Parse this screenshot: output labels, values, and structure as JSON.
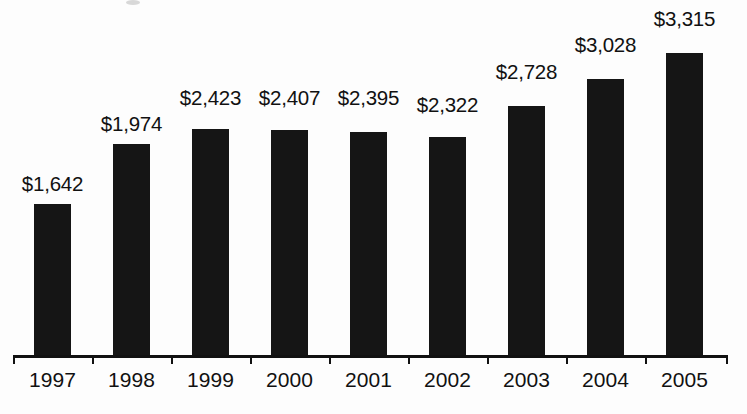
{
  "chart_data": {
    "type": "bar",
    "title": "",
    "subtitle": "",
    "xlabel": "",
    "ylabel": "",
    "categories": [
      "1997",
      "1998",
      "1999",
      "2000",
      "2001",
      "2002",
      "2003",
      "2004",
      "2005"
    ],
    "values": [
      1642,
      1974,
      2423,
      2407,
      2395,
      2322,
      2728,
      3028,
      3315
    ],
    "data_labels": [
      "$1,642",
      "$1,974",
      "$2,423",
      "$2,407",
      "$2,395",
      "$2,322",
      "$2,728",
      "$3,028",
      "$3,315"
    ],
    "series": [
      {
        "name": "",
        "values": [
          1642,
          1974,
          2423,
          2407,
          2395,
          2322,
          2728,
          3028,
          3315
        ]
      }
    ],
    "ylim": [
      0,
      3600
    ],
    "grid": false,
    "legend": false,
    "legend_position": "none",
    "value_prefix": "$",
    "bar_color": "#151515",
    "text_color": "#111111",
    "axis_color": "#111111",
    "background_color": "#fdfdfd",
    "annotations": []
  },
  "bars": [
    {
      "category": "1997",
      "value": 1642,
      "label": "$1,642",
      "left": 13,
      "bar_height": 153,
      "label_top": 172
    },
    {
      "category": "1998",
      "value": 1974,
      "label": "$1,974",
      "left": 92,
      "bar_height": 213,
      "label_top": 112
    },
    {
      "category": "1999",
      "value": 2423,
      "label": "$2,423",
      "left": 171,
      "bar_height": 228,
      "label_top": 86
    },
    {
      "category": "2000",
      "value": 2407,
      "label": "$2,407",
      "left": 250,
      "bar_height": 227,
      "label_top": 86
    },
    {
      "category": "2001",
      "value": 2395,
      "label": "$2,395",
      "left": 329,
      "bar_height": 225,
      "label_top": 86
    },
    {
      "category": "2002",
      "value": 2322,
      "label": "$2,322",
      "left": 408,
      "bar_height": 220,
      "label_top": 93
    },
    {
      "category": "2003",
      "value": 2728,
      "label": "$2,728",
      "left": 487,
      "bar_height": 251,
      "label_top": 60
    },
    {
      "category": "2004",
      "value": 3028,
      "label": "$3,028",
      "left": 566,
      "bar_height": 278,
      "label_top": 33
    },
    {
      "category": "2005",
      "value": 3315,
      "label": "$3,315",
      "left": 645,
      "bar_height": 304,
      "label_top": 7
    }
  ],
  "axis": {
    "tick_positions": [
      13,
      92,
      171,
      250,
      329,
      408,
      487,
      566,
      645,
      726
    ]
  }
}
